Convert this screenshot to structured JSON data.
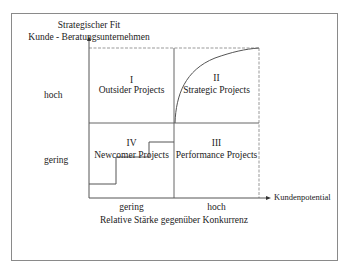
{
  "y_axis": {
    "title_line1": "Strategischer Fit",
    "title_line2": "Kunde - Beratungsunternehmen",
    "ticks": [
      "hoch",
      "gering"
    ]
  },
  "x_axis": {
    "arrow_label": "Kundenpotential",
    "ticks": [
      "gering",
      "hoch"
    ],
    "title": "Relative Stärke gegenüber Konkurrenz"
  },
  "quadrants": [
    {
      "id": "I",
      "numeral": "I",
      "label": "Outsider Projects",
      "position": "top-left"
    },
    {
      "id": "II",
      "numeral": "II",
      "label": "Strategic Projects",
      "position": "top-right"
    },
    {
      "id": "III",
      "numeral": "III",
      "label": "Performance Projects",
      "position": "bottom-right"
    },
    {
      "id": "IV",
      "numeral": "IV",
      "label": "Newcomer Projects",
      "position": "bottom-left"
    }
  ],
  "colors": {
    "line": "#555555",
    "dashed": "#999999",
    "frame": "#8a8a8a"
  }
}
